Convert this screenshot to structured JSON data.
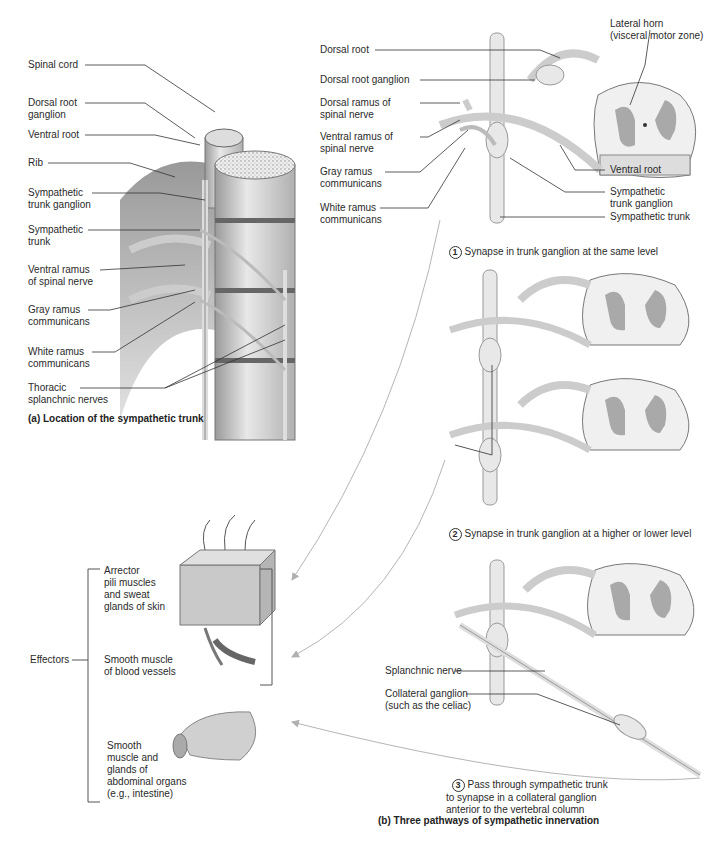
{
  "panel_a": {
    "caption": "(a) Location of the sympathetic trunk",
    "labels": {
      "spinal_cord": "Spinal cord",
      "dorsal_root_ganglion": "Dorsal root\nganglion",
      "ventral_root": "Ventral root",
      "rib": "Rib",
      "sympathetic_trunk_ganglion": "Sympathetic\ntrunk ganglion",
      "sympathetic_trunk": "Sympathetic\ntrunk",
      "ventral_ramus": "Ventral ramus\nof spinal nerve",
      "gray_ramus": "Gray ramus\ncommunicans",
      "white_ramus": "White ramus\ncommunicans",
      "thoracic_splanchnic": "Thoracic\nsplanchnic nerves"
    }
  },
  "panel_b": {
    "caption": "(b) Three pathways of sympathetic innervation",
    "diagram1_labels": {
      "dorsal_root": "Dorsal root",
      "dorsal_root_ganglion": "Dorsal root ganglion",
      "dorsal_ramus": "Dorsal ramus of\nspinal nerve",
      "ventral_ramus": "Ventral ramus of\nspinal nerve",
      "gray_ramus": "Gray ramus\ncommunicans",
      "white_ramus": "White ramus\ncommunicans",
      "lateral_horn": "Lateral horn\n(visceral motor zone)",
      "ventral_root": "Ventral root",
      "sympathetic_trunk_ganglion": "Sympathetic\ntrunk ganglion",
      "sympathetic_trunk": "Sympathetic trunk"
    },
    "pathways": [
      {
        "number": "1",
        "text": "Synapse in trunk ganglion at the same level"
      },
      {
        "number": "2",
        "text": "Synapse in trunk ganglion at a higher or lower level"
      },
      {
        "number": "3",
        "text": "Pass through sympathetic trunk\nto synapse in a collateral ganglion\nanterior to the vertebral column"
      }
    ],
    "diagram3_labels": {
      "splanchnic_nerve": "Splanchnic nerve",
      "collateral_ganglion": "Collateral ganglion\n(such as the celiac)"
    }
  },
  "effectors": {
    "title": "Effectors",
    "items": [
      {
        "text": "Arrector\npili muscles\nand sweat\nglands of skin"
      },
      {
        "text": "Smooth muscle\nof blood vessels"
      },
      {
        "text": "Smooth\nmuscle and\nglands of\nabdominal organs\n(e.g., intestine)"
      }
    ]
  },
  "colors": {
    "line": "#333333",
    "nerve_fill": "#e6e6e6",
    "gray_matter": "#a9a9a9",
    "arrow": "#b5b5b5"
  }
}
